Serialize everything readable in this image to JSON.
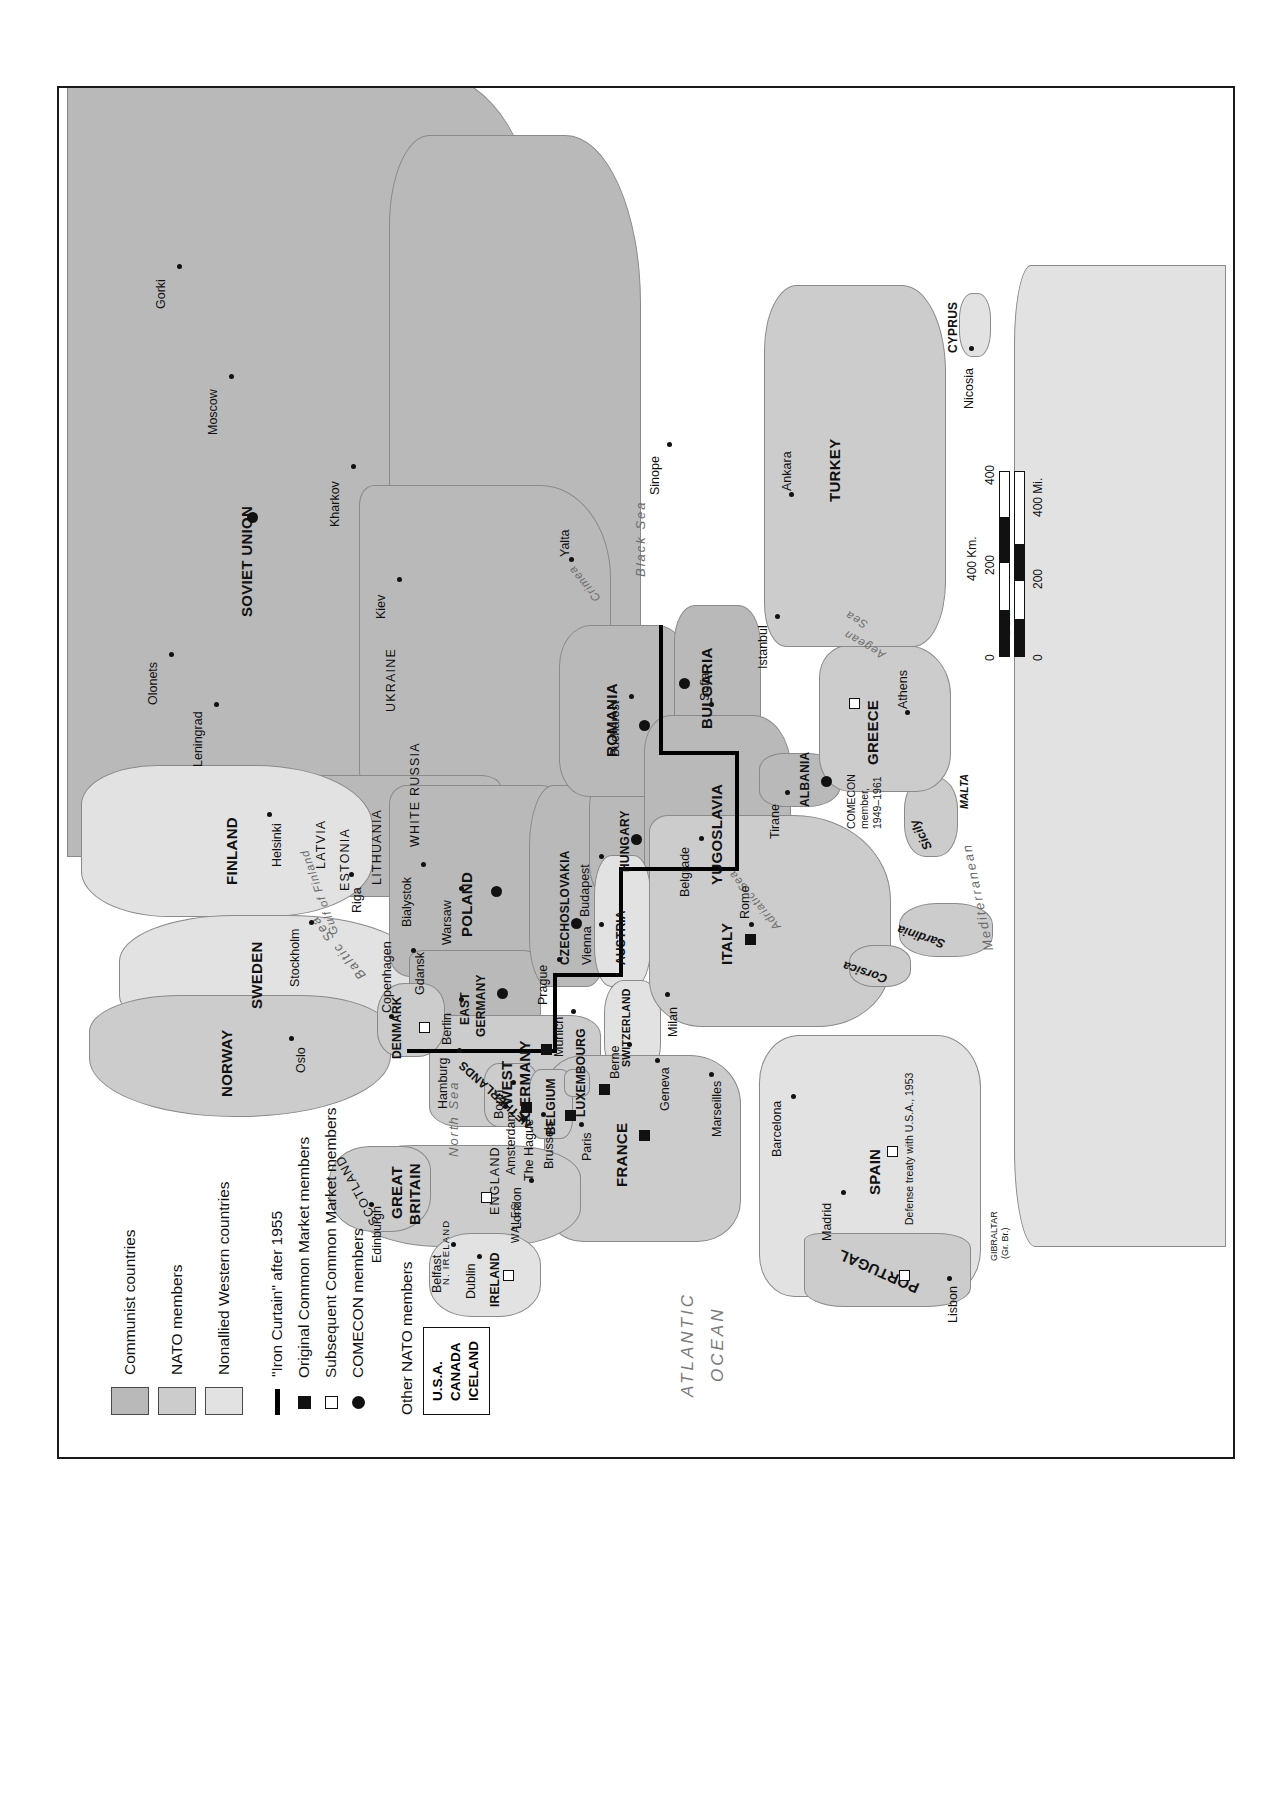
{
  "legend": {
    "area_items": [
      {
        "label": "Communist countries",
        "color": "#b9b9b9"
      },
      {
        "label": "NATO members",
        "color": "#cccccc"
      },
      {
        "label": "Nonallied Western countries",
        "color": "#e2e2e2"
      }
    ],
    "line_item": {
      "label": "\"Iron Curtain\" after 1955",
      "color": "#000000"
    },
    "symbol_items": [
      {
        "label": "Original Common Market members",
        "symbol": "filled-square"
      },
      {
        "label": "Subsequent Common Market members",
        "symbol": "open-square"
      },
      {
        "label": "COMECON members",
        "symbol": "filled-circle"
      }
    ],
    "other_nato_heading": "Other NATO members",
    "other_nato_members": [
      "U.S.A.",
      "CANADA",
      "ICELAND"
    ]
  },
  "scale": {
    "km_label": "400 Km.",
    "mi_label": "400 Mi.",
    "km_ticks": [
      "0",
      "200",
      "400"
    ],
    "mi_ticks": [
      "0",
      "200",
      "400"
    ]
  },
  "oceans": [
    {
      "name": "ATLANTIC OCEAN",
      "line1": "ATLANTIC",
      "line2": "OCEAN"
    },
    {
      "name": "North Sea",
      "label": "North Sea"
    },
    {
      "name": "Baltic Sea",
      "label": "Baltic Sea"
    },
    {
      "name": "Black Sea",
      "label": "Black Sea"
    },
    {
      "name": "Mediterranean Sea",
      "label": "Mediterranean Sea"
    },
    {
      "name": "Adriatic Sea",
      "label": "Adriatic Sea"
    },
    {
      "name": "Aegean Sea",
      "label": "Aegean Sea"
    },
    {
      "name": "Gulf of Finland",
      "label": "Gulf of Finland"
    }
  ],
  "water_labels": {
    "atlantic_1": "ATLANTIC",
    "atlantic_2": "OCEAN",
    "north_sea": "North Sea",
    "baltic_sea": "Baltic Sea",
    "black_sea": "Black Sea",
    "mediterranean": "Mediterranean",
    "med_sea": "Sea",
    "adriatic": "Adriatic Sea",
    "aegean": "Aegean",
    "aegean_sea": "Sea",
    "gulf_finland": "Gulf of Finland"
  },
  "countries": [
    {
      "name": "SOVIET UNION",
      "bloc": "communist",
      "comecon": true
    },
    {
      "name": "FINLAND",
      "bloc": "nonallied"
    },
    {
      "name": "SWEDEN",
      "bloc": "nonallied"
    },
    {
      "name": "NORWAY",
      "bloc": "nato"
    },
    {
      "name": "DENMARK",
      "bloc": "nato",
      "common_market": "subsequent"
    },
    {
      "name": "POLAND",
      "bloc": "communist",
      "comecon": true
    },
    {
      "name": "CZECHOSLOVAKIA",
      "bloc": "communist",
      "comecon": true
    },
    {
      "name": "HUNGARY",
      "bloc": "communist",
      "comecon": true
    },
    {
      "name": "ROMANIA",
      "bloc": "communist",
      "comecon": true
    },
    {
      "name": "BULGARIA",
      "bloc": "communist",
      "comecon": true
    },
    {
      "name": "ALBANIA",
      "bloc": "communist",
      "comecon": true
    },
    {
      "name": "YUGOSLAVIA",
      "bloc": "communist"
    },
    {
      "name": "EAST GERMANY",
      "bloc": "communist",
      "comecon": true
    },
    {
      "name": "WEST GERMANY",
      "bloc": "nato",
      "common_market": "original"
    },
    {
      "name": "FRANCE",
      "bloc": "nato",
      "common_market": "original"
    },
    {
      "name": "ITALY",
      "bloc": "nato",
      "common_market": "original"
    },
    {
      "name": "BELGIUM",
      "bloc": "nato",
      "common_market": "original"
    },
    {
      "name": "NETHERLANDS",
      "bloc": "nato",
      "common_market": "original"
    },
    {
      "name": "LUXEMBOURG",
      "bloc": "nato",
      "common_market": "original"
    },
    {
      "name": "GREAT BRITAIN",
      "bloc": "nato",
      "common_market": "subsequent"
    },
    {
      "name": "IRELAND",
      "bloc": "nonallied",
      "common_market": "subsequent"
    },
    {
      "name": "SPAIN",
      "bloc": "nonallied"
    },
    {
      "name": "PORTUGAL",
      "bloc": "nato",
      "common_market": "subsequent"
    },
    {
      "name": "GREECE",
      "bloc": "nato",
      "common_market": "subsequent"
    },
    {
      "name": "TURKEY",
      "bloc": "nato"
    },
    {
      "name": "AUSTRIA",
      "bloc": "nonallied"
    },
    {
      "name": "SWITZERLAND",
      "bloc": "nonallied"
    },
    {
      "name": "CYPRUS",
      "bloc": "nonallied"
    }
  ],
  "country_labels": {
    "soviet_union": "SOVIET UNION",
    "finland": "FINLAND",
    "sweden": "SWEDEN",
    "norway": "NORWAY",
    "denmark": "DENMARK",
    "poland": "POLAND",
    "czechoslovakia": "CZECHOSLOVAKIA",
    "hungary": "HUNGARY",
    "romania": "ROMANIA",
    "bulgaria": "BULGARIA",
    "albania": "ALBANIA",
    "yugoslavia": "YUGOSLAVIA",
    "east_germany_1": "EAST",
    "east_germany_2": "GERMANY",
    "west_germany_1": "WEST",
    "west_germany_2": "GERMANY",
    "france": "FRANCE",
    "italy": "ITALY",
    "belgium": "BELGIUM",
    "netherlands": "NETHERLANDS",
    "luxembourg": "LUXEMBOURG",
    "great_britain_1": "GREAT",
    "great_britain_2": "BRITAIN",
    "england": "ENGLAND",
    "scotland": "SCOTLAND",
    "wales": "WALES",
    "n_ireland": "N. IRELAND",
    "ireland": "IRELAND",
    "spain": "SPAIN",
    "portugal": "PORTUGAL",
    "greece": "GREECE",
    "turkey": "TURKEY",
    "austria": "AUSTRIA",
    "switzerland": "SWITZERLAND",
    "cyprus": "CYPRUS"
  },
  "regions": [
    {
      "name": "UKRAINE"
    },
    {
      "name": "WHITE RUSSIA"
    },
    {
      "name": "LATVIA"
    },
    {
      "name": "ESTONIA"
    },
    {
      "name": "LITHUANIA"
    },
    {
      "name": "Crimea"
    }
  ],
  "region_labels": {
    "ukraine": "UKRAINE",
    "white_russia": "WHITE RUSSIA",
    "latvia": "LATVIA",
    "estonia": "ESTONIA",
    "lithuania": "LITHUANIA",
    "crimea": "Crimea"
  },
  "islands": [
    {
      "name": "Sicily"
    },
    {
      "name": "Sardinia"
    },
    {
      "name": "Corsica"
    },
    {
      "name": "MALTA"
    },
    {
      "name": "CYPRUS"
    }
  ],
  "island_labels": {
    "sicily": "Sicily",
    "sardinia": "Sardinia",
    "corsica": "Corsica",
    "malta": "MALTA"
  },
  "cities": [
    {
      "name": "Gorki"
    },
    {
      "name": "Moscow"
    },
    {
      "name": "Kharkov"
    },
    {
      "name": "Kiev"
    },
    {
      "name": "Olonets"
    },
    {
      "name": "Leningrad"
    },
    {
      "name": "Helsinki"
    },
    {
      "name": "Stockholm"
    },
    {
      "name": "Oslo"
    },
    {
      "name": "Copenhagen"
    },
    {
      "name": "Riga"
    },
    {
      "name": "Gdansk"
    },
    {
      "name": "Bialystok"
    },
    {
      "name": "Warsaw"
    },
    {
      "name": "Prague"
    },
    {
      "name": "Budapest"
    },
    {
      "name": "Vienna"
    },
    {
      "name": "Berlin"
    },
    {
      "name": "Bonn"
    },
    {
      "name": "Hamburg"
    },
    {
      "name": "Munich"
    },
    {
      "name": "Berne"
    },
    {
      "name": "Geneva"
    },
    {
      "name": "Milan"
    },
    {
      "name": "Rome"
    },
    {
      "name": "Marseilles"
    },
    {
      "name": "Paris"
    },
    {
      "name": "Brussels"
    },
    {
      "name": "Amsterdam"
    },
    {
      "name": "The Hague"
    },
    {
      "name": "London"
    },
    {
      "name": "Edinburgh"
    },
    {
      "name": "Belfast"
    },
    {
      "name": "Dublin"
    },
    {
      "name": "Madrid"
    },
    {
      "name": "Barcelona"
    },
    {
      "name": "Lisbon"
    },
    {
      "name": "Belgrade"
    },
    {
      "name": "Tirane"
    },
    {
      "name": "Sofia"
    },
    {
      "name": "Bucharest"
    },
    {
      "name": "Athens"
    },
    {
      "name": "Istanbul"
    },
    {
      "name": "Ankara"
    },
    {
      "name": "Sinope"
    },
    {
      "name": "Yalta"
    },
    {
      "name": "Nicosia"
    }
  ],
  "city_labels": {
    "gorki": "Gorki",
    "moscow": "Moscow",
    "kharkov": "Kharkov",
    "kiev": "Kiev",
    "olonets": "Olonets",
    "leningrad": "Leningrad",
    "helsinki": "Helsinki",
    "stockholm": "Stockholm",
    "oslo": "Oslo",
    "copenhagen": "Copenhagen",
    "riga": "Riga",
    "gdansk": "Gdansk",
    "bialystok": "Bialystok",
    "warsaw": "Warsaw",
    "prague": "Prague",
    "budapest": "Budapest",
    "vienna": "Vienna",
    "berlin": "Berlin",
    "bonn": "Bonn",
    "hamburg": "Hamburg",
    "munich": "Munich",
    "berne": "Berne",
    "geneva": "Geneva",
    "milan": "Milan",
    "rome": "Rome",
    "marseilles": "Marseilles",
    "paris": "Paris",
    "brussels": "Brussels",
    "amsterdam": "Amsterdam",
    "the_hague": "The Hague",
    "london": "London",
    "edinburgh": "Edinburgh",
    "belfast": "Belfast",
    "dublin": "Dublin",
    "madrid": "Madrid",
    "barcelona": "Barcelona",
    "lisbon": "Lisbon",
    "belgrade": "Belgrade",
    "tirane": "Tirane",
    "sofia": "Sofia",
    "bucharest": "Bucharest",
    "athens": "Athens",
    "istanbul": "Istanbul",
    "ankara": "Ankara",
    "sinope": "Sinope",
    "yalta": "Yalta",
    "nicosia": "Nicosia"
  },
  "annotations": {
    "albania_comecon_1": "COMECON",
    "albania_comecon_2": "member,",
    "albania_comecon_3": "1949–1961",
    "spain_treaty": "Defense treaty with U.S.A., 1953",
    "gibraltar_1": "GIBRALTAR",
    "gibraltar_2": "(Gr. Br.)"
  }
}
